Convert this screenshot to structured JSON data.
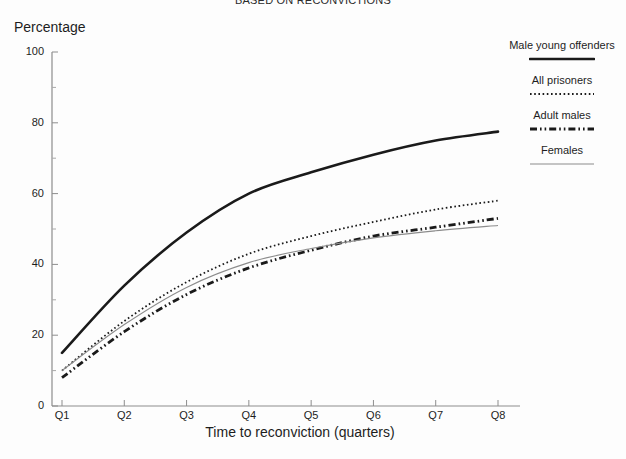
{
  "title_partial": "BASED ON RECONVICTIONS",
  "axis": {
    "y_title": "Percentage",
    "x_title": "Time to reconviction (quarters)"
  },
  "legend": {
    "entries": [
      {
        "label": "Male young offenders",
        "style": "thick-solid",
        "color": "#1a1a1a"
      },
      {
        "label": "All prisoners",
        "style": "dotted",
        "color": "#1a1a1a"
      },
      {
        "label": "Adult males",
        "style": "dash-dot-dot",
        "color": "#1a1a1a"
      },
      {
        "label": "Females",
        "style": "thin-solid",
        "color": "#8c8c8c"
      }
    ]
  },
  "chart_data": {
    "type": "line",
    "title": "BASED ON RECONVICTIONS",
    "xlabel": "Time to reconviction (quarters)",
    "ylabel": "Percentage",
    "categories": [
      "Q1",
      "Q2",
      "Q3",
      "Q4",
      "Q5",
      "Q6",
      "Q7",
      "Q8"
    ],
    "ylim": [
      0,
      100
    ],
    "yticks": [
      0,
      20,
      40,
      60,
      80,
      100
    ],
    "yticks_minor": [
      10,
      30,
      50,
      70,
      90
    ],
    "grid": false,
    "legend_position": "right",
    "series": [
      {
        "name": "Male young offenders",
        "style": "thick-solid",
        "color": "#1a1a1a",
        "values": [
          15,
          34,
          49,
          60,
          66,
          71,
          75,
          77.5
        ]
      },
      {
        "name": "All prisoners",
        "style": "dotted",
        "color": "#1a1a1a",
        "values": [
          10,
          24,
          35,
          43,
          48,
          52,
          55.5,
          58
        ]
      },
      {
        "name": "Adult males",
        "style": "dash-dot-dot",
        "color": "#1a1a1a",
        "values": [
          8,
          21,
          31.5,
          39,
          44,
          48,
          50.5,
          53
        ]
      },
      {
        "name": "Females",
        "style": "thin-solid",
        "color": "#8c8c8c",
        "values": [
          10,
          23,
          33.5,
          40.5,
          44.5,
          47.5,
          49.5,
          51
        ]
      }
    ]
  },
  "ytick_labels": [
    "100",
    "80",
    "60",
    "40",
    "20",
    "0"
  ],
  "xtick_labels": [
    "Q1",
    "Q2",
    "Q3",
    "Q4",
    "Q5",
    "Q6",
    "Q7",
    "Q8"
  ]
}
